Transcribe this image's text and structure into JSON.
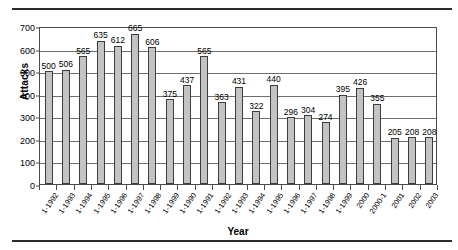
{
  "chart_data": {
    "type": "bar",
    "title": "",
    "xlabel": "Year",
    "ylabel": "Attacks",
    "ylim": [
      0,
      700
    ],
    "yticks": [
      0,
      100,
      200,
      300,
      400,
      500,
      600,
      700
    ],
    "grid": true,
    "legend": false,
    "bar_color": "#c3c3c3",
    "bar_border_color": "#3d3d3d",
    "categories": [
      "1-1992",
      "1-1993",
      "1-1994",
      "1-1995",
      "1-1996",
      "1-1997",
      "1-1998",
      "1-1999",
      "1-1990",
      "1-1991",
      "1-1992",
      "1-1993",
      "1-1994",
      "1-1995",
      "1-1996",
      "1-1997",
      "1-1998",
      "1-1999",
      "2000",
      "2000-1",
      "2001",
      "2002",
      "2003"
    ],
    "values": [
      500,
      506,
      565,
      635,
      612,
      665,
      606,
      375,
      437,
      565,
      363,
      431,
      322,
      440,
      296,
      304,
      274,
      395,
      426,
      355,
      205,
      208,
      208
    ]
  },
  "axes": {
    "y_title": "Attacks",
    "x_title": "Year"
  }
}
